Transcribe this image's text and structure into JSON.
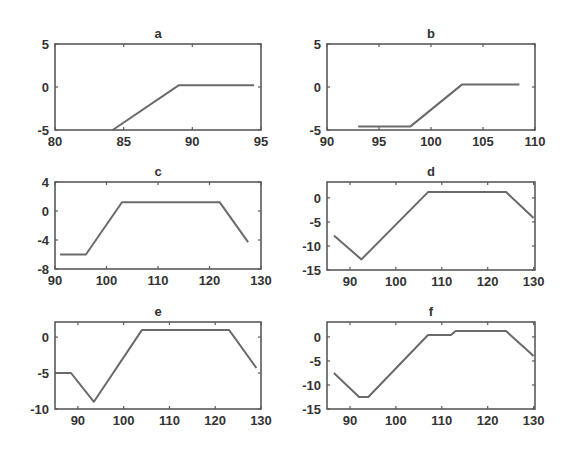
{
  "chart_data": [
    {
      "id": "a",
      "type": "line",
      "title": "a",
      "xlim": [
        80,
        95
      ],
      "ylim": [
        -5,
        5
      ],
      "xticks": [
        80,
        85,
        90,
        95
      ],
      "yticks": [
        -5,
        0,
        5
      ],
      "xlabel": "",
      "ylabel": "",
      "grid": false,
      "box": {
        "x0": 55,
        "y0": 44,
        "x1": 261,
        "y1": 130
      },
      "series": [
        {
          "name": "a",
          "x": [
            84.2,
            89,
            94.5
          ],
          "y": [
            -5,
            0.2,
            0.2
          ]
        }
      ]
    },
    {
      "id": "b",
      "type": "line",
      "title": "b",
      "xlim": [
        90,
        110
      ],
      "ylim": [
        -5,
        5
      ],
      "xticks": [
        90,
        95,
        100,
        105,
        110
      ],
      "yticks": [
        -5,
        0,
        5
      ],
      "xlabel": "",
      "ylabel": "",
      "grid": false,
      "box": {
        "x0": 327,
        "y0": 44,
        "x1": 535,
        "y1": 130
      },
      "series": [
        {
          "name": "b",
          "x": [
            93,
            98,
            103,
            108.5
          ],
          "y": [
            -4.6,
            -4.6,
            0.3,
            0.3
          ]
        }
      ]
    },
    {
      "id": "c",
      "type": "line",
      "title": "c",
      "xlim": [
        90,
        130
      ],
      "ylim": [
        -8,
        4
      ],
      "xticks": [
        90,
        100,
        110,
        120,
        130
      ],
      "yticks": [
        -8,
        -4,
        0,
        4
      ],
      "xlabel": "",
      "ylabel": "",
      "grid": false,
      "box": {
        "x0": 55,
        "y0": 182,
        "x1": 261,
        "y1": 269
      },
      "series": [
        {
          "name": "c",
          "x": [
            91,
            96,
            103,
            122,
            127.5
          ],
          "y": [
            -6,
            -6,
            1.2,
            1.2,
            -4.3
          ]
        }
      ]
    },
    {
      "id": "d",
      "type": "line",
      "title": "d",
      "xlim": [
        85,
        130.3
      ],
      "ylim": [
        -15,
        3.3
      ],
      "xticks": [
        90,
        100,
        110,
        120,
        130
      ],
      "yticks": [
        -15,
        -10,
        -5,
        0
      ],
      "xlabel": "",
      "ylabel": "",
      "grid": false,
      "box": {
        "x0": 327,
        "y0": 182,
        "x1": 535,
        "y1": 270
      },
      "series": [
        {
          "name": "d",
          "x": [
            86.5,
            92.5,
            107,
            124,
            130
          ],
          "y": [
            -7.8,
            -12.8,
            1.2,
            1.2,
            -4.2
          ]
        }
      ]
    },
    {
      "id": "e",
      "type": "line",
      "title": "e",
      "xlim": [
        85,
        130
      ],
      "ylim": [
        -10,
        2.1
      ],
      "xticks": [
        90,
        100,
        110,
        120,
        130
      ],
      "yticks": [
        -10,
        -5,
        0
      ],
      "xlabel": "",
      "ylabel": "",
      "grid": false,
      "box": {
        "x0": 55,
        "y0": 322,
        "x1": 261,
        "y1": 409
      },
      "series": [
        {
          "name": "e",
          "x": [
            85,
            88.5,
            93.5,
            104,
            123,
            129
          ],
          "y": [
            -5,
            -5,
            -9,
            1,
            1,
            -4.3
          ]
        }
      ]
    },
    {
      "id": "f",
      "type": "line",
      "title": "f",
      "xlim": [
        85,
        130.3
      ],
      "ylim": [
        -15,
        3.1
      ],
      "xticks": [
        90,
        100,
        110,
        120,
        130
      ],
      "yticks": [
        -15,
        -10,
        -5,
        0
      ],
      "xlabel": "",
      "ylabel": "",
      "grid": false,
      "box": {
        "x0": 327,
        "y0": 322,
        "x1": 535,
        "y1": 409
      },
      "series": [
        {
          "name": "f",
          "x": [
            86.5,
            92,
            94,
            107,
            112,
            113,
            124,
            130
          ],
          "y": [
            -7.5,
            -12.5,
            -12.5,
            0.4,
            0.4,
            1.2,
            1.2,
            -4
          ]
        }
      ]
    }
  ],
  "style": {
    "line_color": "#6a6a6a",
    "axis_color": "#5a5a5a",
    "text_color": "#333333",
    "background": "#ffffff"
  }
}
